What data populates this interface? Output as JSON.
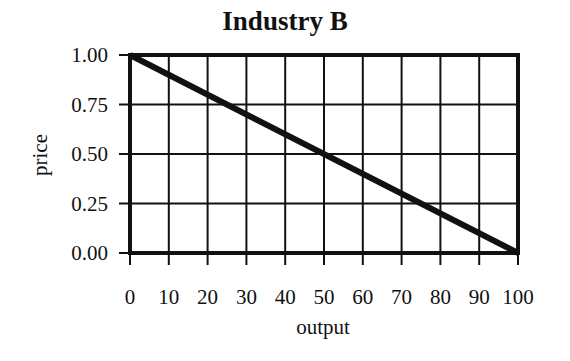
{
  "chart_data": {
    "type": "line",
    "title": "Industry B",
    "xlabel": "output",
    "ylabel": "price",
    "xlim": [
      0,
      100
    ],
    "ylim": [
      0,
      1
    ],
    "grid": true,
    "legend": null,
    "x_ticks": [
      0,
      10,
      20,
      30,
      40,
      50,
      60,
      70,
      80,
      90,
      100
    ],
    "x_tick_labels": [
      "0",
      "10",
      "20",
      "30",
      "40",
      "50",
      "60",
      "70",
      "80",
      "90",
      "100"
    ],
    "y_ticks": [
      0,
      0.25,
      0.5,
      0.75,
      1.0
    ],
    "y_tick_labels": [
      "0.00",
      "0.25",
      "0.50",
      "0.75",
      "1.00"
    ],
    "series": [
      {
        "name": "demand",
        "x": [
          0,
          100
        ],
        "y": [
          1.0,
          0.0
        ],
        "color": "#111111"
      }
    ]
  },
  "colors": {
    "line": "#111111",
    "grid": "#111111",
    "background": "#ffffff"
  }
}
